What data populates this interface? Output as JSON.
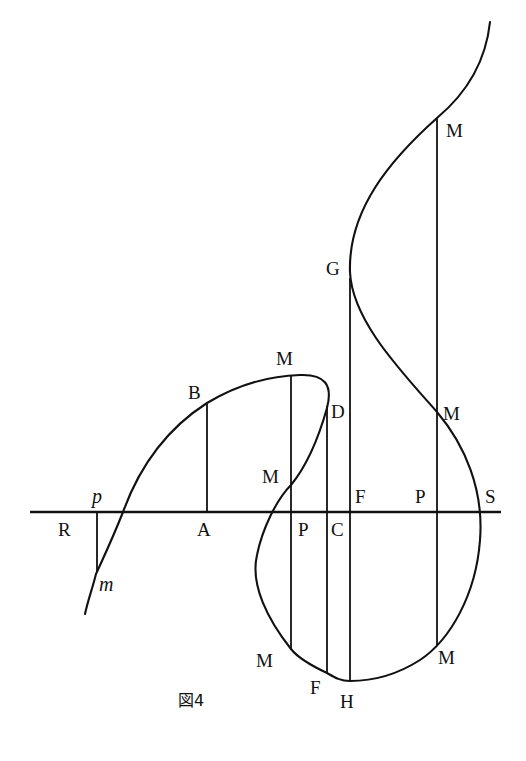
{
  "figure": {
    "caption": "図4",
    "type": "geometric curve diagram",
    "colors": {
      "ink": "#111111",
      "paper": "#ffffff"
    }
  },
  "labels": {
    "M_top": "M",
    "G": "G",
    "M_upper_left": "M",
    "B": "B",
    "D": "D",
    "M_right_mid": "M",
    "M_mid_left": "M",
    "p_small": "p",
    "F_axis": "F",
    "P_right": "P",
    "S": "S",
    "R": "R",
    "A": "A",
    "P_left": "P",
    "C": "C",
    "m_small": "m",
    "M_bottom_left": "M",
    "M_bottom_right": "M",
    "F_bottom": "F",
    "H": "H"
  },
  "axis": {
    "name": "RS",
    "from": "R",
    "to": "S"
  },
  "ordinates": [
    {
      "name": "pm",
      "from": "p",
      "to": "m"
    },
    {
      "name": "AB",
      "from": "A",
      "to": "B"
    },
    {
      "name": "PM-left",
      "from": "M (top)",
      "to": "M (bottom-left)",
      "through": "P"
    },
    {
      "name": "CD",
      "from": "D",
      "to": "F (bottom)",
      "through": "C"
    },
    {
      "name": "FG",
      "from": "G",
      "to": "H",
      "through": "F"
    },
    {
      "name": "PM-right",
      "from": "M (top-right)",
      "to": "M (bottom-right)",
      "through": "P"
    }
  ]
}
